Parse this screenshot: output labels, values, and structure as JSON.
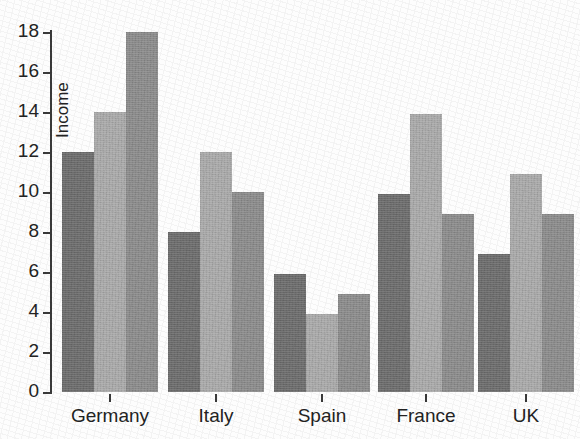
{
  "chart_data": {
    "type": "bar",
    "title": "",
    "xlabel": "",
    "ylabel": "Income",
    "ylim": [
      0,
      18
    ],
    "yticks": [
      0,
      2,
      4,
      6,
      8,
      10,
      12,
      14,
      16,
      18
    ],
    "ytick_labels": [
      "0",
      "2",
      "4",
      "6",
      "8",
      "10",
      "12",
      "14",
      "16",
      "18"
    ],
    "grid": false,
    "legend": false,
    "legend_position": "none",
    "categories": [
      "Germany",
      "Italy",
      "Spain",
      "France",
      "UK"
    ],
    "series": [
      {
        "name": "Series 1",
        "color": "#6d6d6d",
        "values": [
          12,
          8,
          5.9,
          9.9,
          6.9
        ]
      },
      {
        "name": "Series 2",
        "color": "#aaaaaa",
        "values": [
          14,
          12,
          3.9,
          13.9,
          10.9
        ]
      },
      {
        "name": "Series 3",
        "color": "#8c8c8c",
        "values": [
          18,
          10,
          4.9,
          8.9,
          8.9
        ]
      }
    ]
  },
  "axis": {
    "y_title": "Income"
  }
}
